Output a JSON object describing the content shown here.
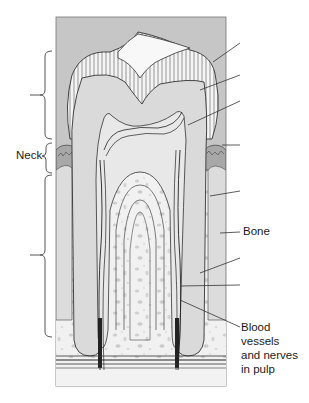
{
  "diagram": {
    "labels": {
      "neck": "Neck",
      "bone": "Bone",
      "blood_vessels_line1": "Blood",
      "blood_vessels_line2": "vessels",
      "blood_vessels_line3": "and nerves",
      "blood_vessels_line4": "in pulp"
    },
    "unlabeled_leaders": [
      {
        "target": "enamel",
        "y": 43
      },
      {
        "target": "dentin",
        "y": 75
      },
      {
        "target": "pulp-cavity",
        "y": 101
      },
      {
        "target": "gingiva",
        "y": 145
      },
      {
        "target": "root-dentin",
        "y": 191
      },
      {
        "target": "periodontal-ligament",
        "y": 258
      },
      {
        "target": "cementum",
        "y": 285
      }
    ],
    "braces": [
      {
        "region": "crown",
        "top": 51,
        "bottom": 139,
        "label": ""
      },
      {
        "region": "neck",
        "top": 143,
        "bottom": 173,
        "label": "Neck"
      },
      {
        "region": "root",
        "top": 175,
        "bottom": 337,
        "label": ""
      }
    ],
    "colors": {
      "background": "#c8c8c8",
      "enamel": "#f4f4f4",
      "dentin": "#dcdcdc",
      "pulp": "#e6e6e6",
      "bone": "#f0f0f0",
      "bone_spots": "#cfcfcf",
      "gum": "#a9a9a9",
      "line": "#333333"
    }
  }
}
